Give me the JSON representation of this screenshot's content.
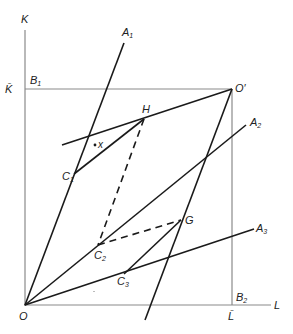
{
  "diagram": {
    "type": "edgeworth-box-production",
    "axes": {
      "y_label": "K",
      "x_label": "L",
      "y_endowment_label": "K̄",
      "x_endowment_label": "L̄"
    },
    "points": {
      "origin": "O",
      "origin_prime": "O′",
      "b1": "B",
      "b1_sub": "1",
      "b2": "B",
      "b2_sub": "2",
      "h": "H",
      "g": "G",
      "c1": "C",
      "c1_sub": "1",
      "c2": "C",
      "c2_sub": "2",
      "c3": "C",
      "c3_sub": "3",
      "x": "x"
    },
    "rays": {
      "a1": "A",
      "a1_sub": "1",
      "a2": "A",
      "a2_sub": "2",
      "a3": "A",
      "a3_sub": "3"
    },
    "colors": {
      "line": "#1a1a1a",
      "axis": "#8a8a8a",
      "background": "#ffffff"
    }
  }
}
